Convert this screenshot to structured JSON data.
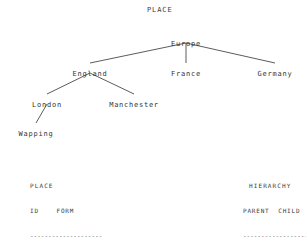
{
  "diagram": {
    "title": "PLACE",
    "nodes": [
      {
        "id": "N1",
        "label": "Europe",
        "x": 186,
        "y": 40
      },
      {
        "id": "N2",
        "label": "England",
        "x": 90,
        "y": 70
      },
      {
        "id": "N3",
        "label": "France",
        "x": 186,
        "y": 70
      },
      {
        "id": "N4",
        "label": "Germany",
        "x": 275,
        "y": 70
      },
      {
        "id": "N5",
        "label": "London",
        "x": 47,
        "y": 101
      },
      {
        "id": "N6",
        "label": "Manchester",
        "x": 134,
        "y": 101
      },
      {
        "id": "N7",
        "label": "Wapping",
        "x": 36,
        "y": 130
      }
    ],
    "edges": [
      {
        "parent": "N1",
        "child": "N2"
      },
      {
        "parent": "N1",
        "child": "N3"
      },
      {
        "parent": "N1",
        "child": "N4"
      },
      {
        "parent": "N2",
        "child": "N5"
      },
      {
        "parent": "N2",
        "child": "N6"
      },
      {
        "parent": "N5",
        "child": "N7"
      }
    ],
    "edge_color": "#4a4a4a"
  },
  "place_table": {
    "title": "PLACE",
    "header": "ID    FORM",
    "rule": "--------------------",
    "rows": [
      "N1    Europe",
      "N2    England",
      "N3    France",
      "N4    Germany",
      "N5    London",
      "N6    Manchester"
    ]
  },
  "hierarchy_table": {
    "title": "HIERARCHY",
    "header": "PARENT  CHILD",
    "rule": "-------------------",
    "rows": [
      "N1      N2",
      "N1      N3",
      "N1      N4",
      "N2      N5",
      "N2      N6",
      "N5      N7"
    ]
  }
}
